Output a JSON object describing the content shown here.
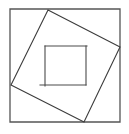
{
  "figure": {
    "canvas": {
      "width": 129,
      "height": 134
    },
    "style": {
      "background_color": "#ffffff",
      "stroke_color": "#3c3c3c",
      "outer_stroke_color": "#555555",
      "inner_stroke_color": "#4a4a4a",
      "stroke_width": 1.1,
      "outer_stroke_width": 1.3,
      "fill": "none"
    },
    "outer_square": {
      "name": "outer-square",
      "points": "10,9 120,9 120,122 10,122",
      "corners": {
        "top_left": [
          10,
          9
        ],
        "top_right": [
          120,
          9
        ],
        "bottom_right": [
          120,
          122
        ],
        "bottom_left": [
          10,
          122
        ]
      },
      "width": 110,
      "height": 113
    },
    "tilted_square": {
      "name": "inscribed-tilted-square",
      "points": "48,10 120,47 84,122 11,85",
      "vertices": {
        "top": [
          48,
          10
        ],
        "right": [
          120,
          47
        ],
        "bottom": [
          84,
          122
        ],
        "left": [
          11,
          85
        ]
      }
    },
    "pinwheel_lines": [
      {
        "name": "pinwheel-line-top",
        "x1": 45,
        "y1": 46,
        "x2": 87,
        "y2": 46
      },
      {
        "name": "pinwheel-line-right",
        "x1": 86,
        "y1": 46,
        "x2": 86,
        "y2": 85
      },
      {
        "name": "pinwheel-line-bottom",
        "x1": 40,
        "y1": 85,
        "x2": 86,
        "y2": 85
      },
      {
        "name": "pinwheel-line-left",
        "x1": 45,
        "y1": 46,
        "x2": 45,
        "y2": 86
      }
    ]
  }
}
